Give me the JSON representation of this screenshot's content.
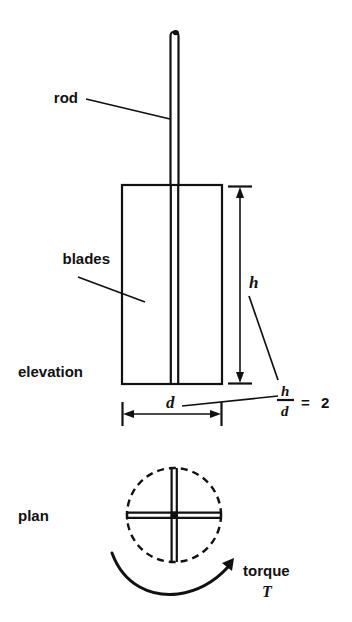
{
  "figure": {
    "background_color": "#ffffff",
    "ink_color": "#111111",
    "labels": {
      "rod": "rod",
      "blades": "blades",
      "elevation": "elevation",
      "plan": "plan",
      "torque": "torque",
      "torque_symbol": "T",
      "height_symbol": "h",
      "diameter_symbol": "d",
      "ratio_numerator": "h",
      "ratio_denominator": "d",
      "ratio_equals": "=",
      "ratio_value": "2"
    },
    "annotations": {
      "ratio_expression": "h/d = 2",
      "elevation_view": {
        "rod_description": "vertical rod drawn as two parallel lines with rounded top cap",
        "blades_description": "rectangular blade outline, height h, width d",
        "height_dimension_label": "h",
        "diameter_dimension_label": "d"
      },
      "plan_view": {
        "circle_style": "dashed",
        "blade_arrangement": "four blades forming a cross",
        "rotation_label": "torque",
        "rotation_direction": "counter-clockwise arc arrow ending at right"
      }
    }
  }
}
